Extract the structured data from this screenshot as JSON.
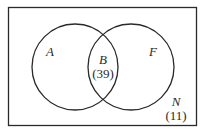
{
  "diagram": {
    "type": "venn",
    "universe": {
      "label": "N",
      "count": "(11)"
    },
    "sets": [
      {
        "label": "A"
      },
      {
        "label": "F"
      }
    ],
    "intersection": {
      "label": "B",
      "count": "(39)"
    },
    "colors": {
      "stroke": "#2a2a2a",
      "background": "#ffffff"
    }
  }
}
